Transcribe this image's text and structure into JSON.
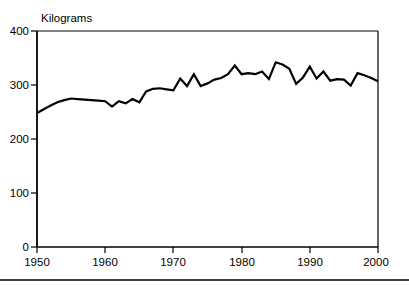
{
  "chart_data": {
    "type": "line",
    "title": "",
    "subtitle": "",
    "xlabel": "",
    "ylabel": "Kilograms",
    "ylabel_position": "top-left-inside",
    "xlim": [
      1950,
      2000
    ],
    "ylim": [
      0,
      400
    ],
    "yticks": [
      0,
      100,
      200,
      300,
      400
    ],
    "ytick_labels": [
      "0",
      "100",
      "200",
      "300",
      "400"
    ],
    "xticks": [
      1950,
      1960,
      1970,
      1980,
      1990,
      2000
    ],
    "xtick_labels": [
      "1950",
      "1960",
      "1970",
      "1980",
      "1990",
      "2000"
    ],
    "grid": false,
    "legend": null,
    "legend_position": "none",
    "line_color": "#000000",
    "line_width": 2.2,
    "frame_color": "#000000",
    "x": [
      1950,
      1951,
      1952,
      1953,
      1954,
      1955,
      1956,
      1957,
      1958,
      1959,
      1960,
      1961,
      1962,
      1963,
      1964,
      1965,
      1966,
      1967,
      1968,
      1969,
      1970,
      1971,
      1972,
      1973,
      1974,
      1975,
      1976,
      1977,
      1978,
      1979,
      1980,
      1981,
      1982,
      1983,
      1984,
      1985,
      1986,
      1987,
      1988,
      1989,
      1990,
      1991,
      1992,
      1993,
      1994,
      1995,
      1996,
      1997,
      1998,
      1999,
      2000
    ],
    "series": [
      {
        "name": "Kilograms",
        "values": [
          248,
          255,
          262,
          268,
          272,
          275,
          274,
          273,
          272,
          271,
          270,
          260,
          270,
          266,
          274,
          268,
          288,
          293,
          294,
          292,
          290,
          312,
          298,
          320,
          298,
          303,
          310,
          313,
          320,
          336,
          320,
          322,
          320,
          325,
          311,
          342,
          338,
          330,
          302,
          314,
          334,
          312,
          325,
          308,
          311,
          310,
          299,
          322,
          318,
          313,
          307
        ]
      }
    ],
    "annotations": []
  },
  "figure": {
    "units_label": "Kilograms",
    "footer_rule": true
  }
}
